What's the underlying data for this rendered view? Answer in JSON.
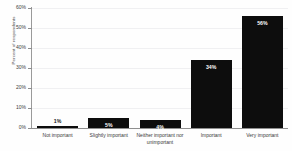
{
  "chart_data": {
    "type": "bar",
    "title": "",
    "xlabel": "",
    "ylabel": "Percent of respondents",
    "ylim": [
      0,
      60
    ],
    "grid": true,
    "legend": "none",
    "categories": [
      "Not important",
      "Slightly important",
      "Neither important nor\nunimportant",
      "Important",
      "Very important"
    ],
    "values": [
      1,
      5,
      4,
      34,
      56
    ],
    "value_labels": [
      "1%",
      "5%",
      "4%",
      "34%",
      "56%"
    ],
    "label_placement": [
      "outside",
      "inside",
      "inside",
      "inside",
      "inside"
    ],
    "ytick_labels": [
      "0%",
      "10%",
      "20%",
      "30%",
      "40%",
      "50%",
      "60%"
    ],
    "ytick_values": [
      0,
      10,
      20,
      30,
      40,
      50,
      60
    ],
    "bar_color": "#0d0d0d",
    "background_color": "#ffffff",
    "gridline_color": "#f0f0f2",
    "axis_color": "#8f8f8f"
  }
}
